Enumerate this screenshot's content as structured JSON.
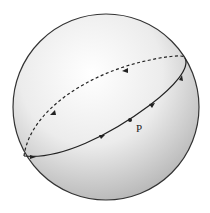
{
  "diagram": {
    "type": "sphere-great-circle",
    "sphere": {
      "cx": 106,
      "cy": 107,
      "r": 93
    },
    "front_arc": {
      "style": "solid",
      "direction_arrows": 4
    },
    "back_arc": {
      "style": "dashed",
      "direction_arrows": 2
    },
    "point": {
      "label": "P"
    }
  },
  "colors": {
    "outline": "#333333",
    "shade_light": "#ffffff",
    "shade_dark": "#b8b8b8"
  }
}
